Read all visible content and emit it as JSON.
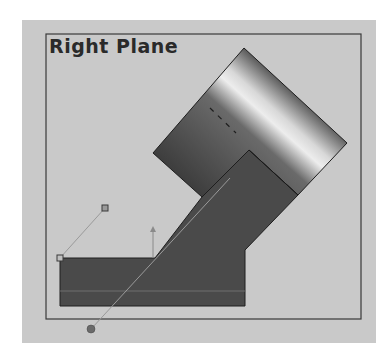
{
  "viewport": {
    "title": "Right Plane",
    "background_color": "#c9c9c9",
    "border_color": "#3a3a3a"
  },
  "model": {
    "body_color": "#4a4a4a",
    "highlight_color": "#e6e6e6",
    "edge_color": "#1e1e1e"
  },
  "sketch": {
    "handle_color": "#8a8a8a",
    "pivot_color": "#6a6a6a",
    "line_color": "#9a9a9a"
  }
}
